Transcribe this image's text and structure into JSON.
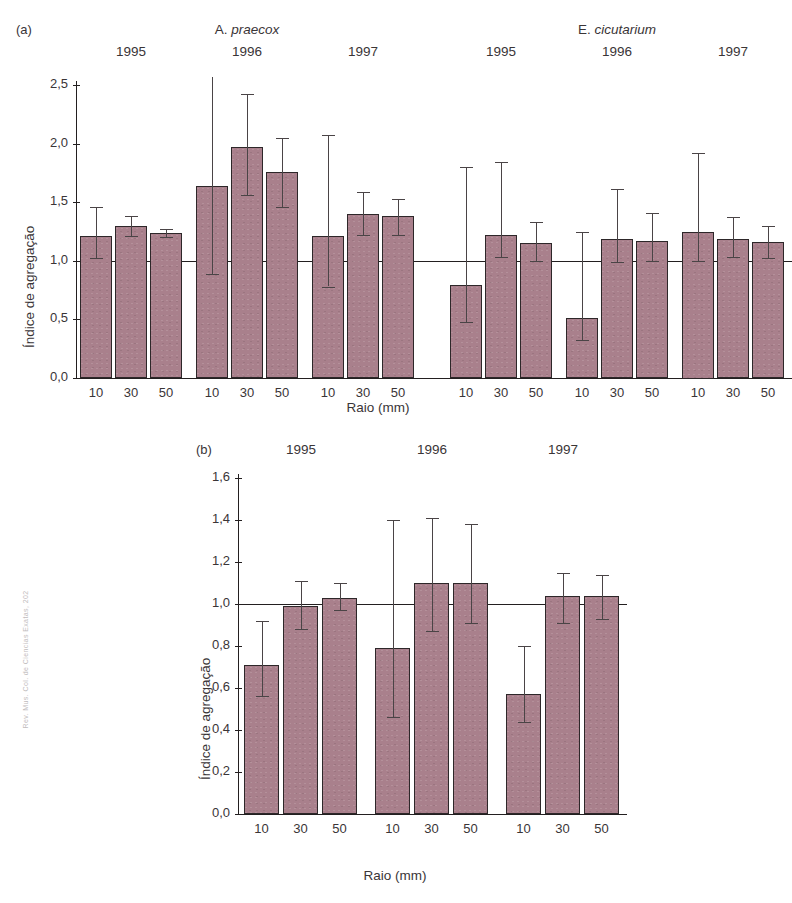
{
  "margin_credit": "Rev. Mus. Col. de Ciencias Exatas, 202",
  "panel_a": {
    "tag": "(a)",
    "species": [
      "A. praecox",
      "E. cicutarium"
    ],
    "species_genus": [
      "A.",
      "E."
    ],
    "species_epithet": [
      "praecox",
      "cicutarium"
    ],
    "years": [
      "1995",
      "1996",
      "1997",
      "1995",
      "1996",
      "1997"
    ],
    "xlabel": "Raio (mm)",
    "ylabel": "Índice de agregação",
    "ytick_labels": [
      "2,5",
      "2,0",
      "1,5",
      "1,0",
      "0,5",
      "0,0"
    ],
    "xtick_labels": [
      "10",
      "30",
      "50",
      "10",
      "30",
      "50",
      "10",
      "30",
      "50",
      "10",
      "30",
      "50",
      "10",
      "30",
      "50",
      "10",
      "30",
      "50"
    ]
  },
  "panel_b": {
    "tag": "(b)",
    "years": [
      "1995",
      "1996",
      "1997"
    ],
    "xlabel": "Raio (mm)",
    "ylabel": "Índice de agregação",
    "ytick_labels": [
      "1,6",
      "1,4",
      "1,2",
      "1,0",
      "0,8",
      "0,6",
      "0,4",
      "0,2",
      "0,0"
    ],
    "xtick_labels": [
      "10",
      "30",
      "50",
      "10",
      "30",
      "50",
      "10",
      "30",
      "50"
    ]
  },
  "colors": {
    "bar_fill": "#a9808c",
    "bar_stroke": "#2d2729",
    "axis": "#231f20",
    "text": "#3a3537"
  },
  "chart_data": [
    {
      "type": "bar",
      "panel": "(a)",
      "title": "Índice de agregação por raio, espécie e ano",
      "xlabel": "Raio (mm)",
      "ylabel": "Índice de agregação",
      "ylim": [
        0.0,
        2.5
      ],
      "ytick_values": [
        0.0,
        0.5,
        1.0,
        1.5,
        2.0,
        2.5
      ],
      "grid": false,
      "legend": "none",
      "reference_line": 1.0,
      "groups": [
        {
          "species": "A. praecox",
          "year": "1995"
        },
        {
          "species": "A. praecox",
          "year": "1996"
        },
        {
          "species": "A. praecox",
          "year": "1997"
        },
        {
          "species": "E. cicutarium",
          "year": "1995"
        },
        {
          "species": "E. cicutarium",
          "year": "1996"
        },
        {
          "species": "E. cicutarium",
          "year": "1997"
        }
      ],
      "categories": [
        "10",
        "30",
        "50",
        "10",
        "30",
        "50",
        "10",
        "30",
        "50",
        "10",
        "30",
        "50",
        "10",
        "30",
        "50",
        "10",
        "30",
        "50"
      ],
      "values": [
        1.21,
        1.3,
        1.24,
        1.64,
        1.97,
        1.76,
        1.21,
        1.4,
        1.38,
        0.79,
        1.22,
        1.15,
        0.51,
        1.19,
        1.17,
        1.25,
        1.19,
        1.16
      ],
      "error_high": [
        1.46,
        1.38,
        1.27,
        2.62,
        2.42,
        2.05,
        2.07,
        1.59,
        1.53,
        1.8,
        1.84,
        1.33,
        1.25,
        1.61,
        1.41,
        1.92,
        1.37,
        1.3
      ],
      "error_low": [
        1.02,
        1.21,
        1.2,
        0.89,
        1.56,
        1.46,
        0.78,
        1.22,
        1.22,
        0.48,
        1.03,
        1.0,
        0.32,
        0.99,
        1.0,
        1.0,
        1.03,
        1.02
      ]
    },
    {
      "type": "bar",
      "panel": "(b)",
      "title": "Índice de agregação por raio e ano",
      "xlabel": "Raio (mm)",
      "ylabel": "Índice de agregação",
      "ylim": [
        0.0,
        1.6
      ],
      "ytick_values": [
        0.0,
        0.2,
        0.4,
        0.6,
        0.8,
        1.0,
        1.2,
        1.4,
        1.6
      ],
      "grid": false,
      "legend": "none",
      "reference_line": 1.0,
      "groups": [
        {
          "year": "1995"
        },
        {
          "year": "1996"
        },
        {
          "year": "1997"
        }
      ],
      "categories": [
        "10",
        "30",
        "50",
        "10",
        "30",
        "50",
        "10",
        "30",
        "50"
      ],
      "values": [
        0.71,
        0.99,
        1.03,
        0.79,
        1.1,
        1.1,
        0.57,
        1.04,
        1.04
      ],
      "error_high": [
        0.92,
        1.11,
        1.1,
        1.4,
        1.41,
        1.38,
        0.8,
        1.15,
        1.14
      ],
      "error_low": [
        0.56,
        0.88,
        0.97,
        0.46,
        0.87,
        0.91,
        0.44,
        0.91,
        0.93
      ]
    }
  ]
}
